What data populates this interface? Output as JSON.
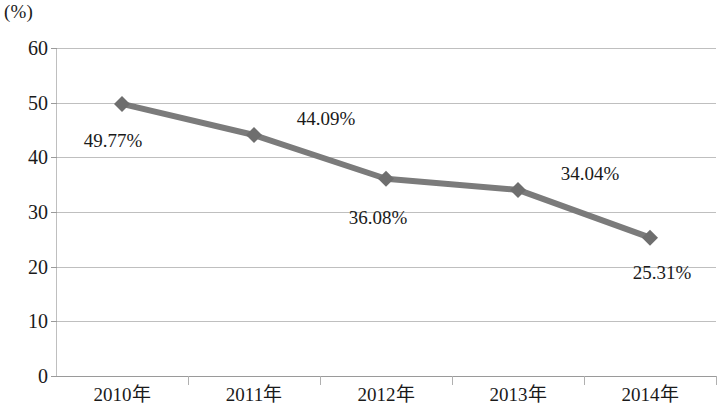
{
  "chart_data": {
    "type": "line",
    "title": "",
    "subtitle": "",
    "xlabel": "",
    "ylabel": "",
    "unit_label": "(%)",
    "categories": [
      "2010年",
      "2011年",
      "2012年",
      "2013年",
      "2014年"
    ],
    "values": [
      49.77,
      44.09,
      36.08,
      34.04,
      25.31
    ],
    "data_labels": [
      "49.77%",
      "44.09%",
      "36.08%",
      "34.04%",
      "25.31%"
    ],
    "ylim": [
      0,
      60
    ],
    "ytick_labels": [
      "0",
      "10",
      "20",
      "30",
      "40",
      "50",
      "60"
    ],
    "ytick_values": [
      0,
      10,
      20,
      30,
      40,
      50,
      60
    ],
    "grid": true,
    "legend": false,
    "series": [
      {
        "name": "",
        "values": [
          49.77,
          44.09,
          36.08,
          34.04,
          25.31
        ],
        "color": "#7b7b7b",
        "marker": "diamond"
      }
    ],
    "colors": {
      "line": "#7b7b7b",
      "marker": "#6e6e6e",
      "gridline": "#bfbfbf",
      "axis": "#9a9a9a",
      "text": "#1a1a1a",
      "background": "#ffffff"
    }
  }
}
